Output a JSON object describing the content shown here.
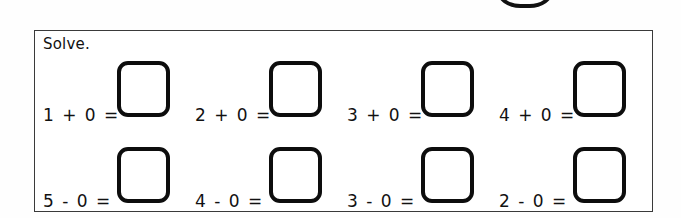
{
  "page": {
    "background_color": "#fefefe",
    "ink_color": "#111111"
  },
  "stamp": {
    "name": "circle-stamp",
    "shape": "circle-outline-clipped"
  },
  "worksheet": {
    "border_color": "#3a3a3a",
    "instruction": "Solve.",
    "rows": [
      {
        "name": "addition-row",
        "problems": [
          {
            "expression": "1 + 0 =",
            "operand_left": "1",
            "operator": "+",
            "operand_right": "0",
            "answer": ""
          },
          {
            "expression": "2 + 0 =",
            "operand_left": "2",
            "operator": "+",
            "operand_right": "0",
            "answer": ""
          },
          {
            "expression": "3 + 0 =",
            "operand_left": "3",
            "operator": "+",
            "operand_right": "0",
            "answer": ""
          },
          {
            "expression": "4 + 0 =",
            "operand_left": "4",
            "operator": "+",
            "operand_right": "0",
            "answer": ""
          }
        ]
      },
      {
        "name": "subtraction-row",
        "problems": [
          {
            "expression": "5 - 0 =",
            "operand_left": "5",
            "operator": "-",
            "operand_right": "0",
            "answer": ""
          },
          {
            "expression": "4 - 0 =",
            "operand_left": "4",
            "operator": "-",
            "operand_right": "0",
            "answer": ""
          },
          {
            "expression": "3 - 0 =",
            "operand_left": "3",
            "operator": "-",
            "operand_right": "0",
            "answer": ""
          },
          {
            "expression": "2 - 0 =",
            "operand_left": "2",
            "operator": "-",
            "operand_right": "0",
            "answer": ""
          }
        ]
      }
    ]
  }
}
